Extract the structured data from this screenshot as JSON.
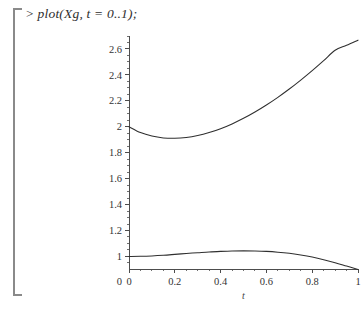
{
  "worksheet": {
    "prompt": ">",
    "command": "plot(Xg, t = 0..1);"
  },
  "chart_data": {
    "type": "line",
    "title": "",
    "xlabel": "t",
    "ylabel": "",
    "xlim": [
      0,
      1
    ],
    "ylim": [
      0.88,
      2.7
    ],
    "grid": false,
    "legend": "none",
    "x_ticks": [
      "0",
      "0.2",
      "0.4",
      "0.6",
      "0.8",
      "1"
    ],
    "x_tick_values": [
      0,
      0.2,
      0.4,
      0.6,
      0.8,
      1
    ],
    "x_minor_step": 0.05,
    "y_ticks": [
      "1",
      "1.2",
      "1.4",
      "1.6",
      "1.8",
      "2",
      "2.2",
      "2.4",
      "2.6"
    ],
    "y_tick_values": [
      1,
      1.2,
      1.4,
      1.6,
      1.8,
      2,
      2.2,
      2.4,
      2.6
    ],
    "y_minor_step": 0.05,
    "y_origin_label": "0",
    "axis_baseline": 0.9,
    "series": [
      {
        "name": "upper-curve",
        "x": [
          0,
          0.05,
          0.1,
          0.15,
          0.2,
          0.25,
          0.3,
          0.35,
          0.4,
          0.45,
          0.5,
          0.55,
          0.6,
          0.65,
          0.7,
          0.75,
          0.8,
          0.85,
          0.9,
          0.95,
          1
        ],
        "values": [
          2.0,
          1.955,
          1.928,
          1.914,
          1.911,
          1.917,
          1.932,
          1.955,
          1.985,
          2.022,
          2.065,
          2.114,
          2.168,
          2.227,
          2.291,
          2.36,
          2.433,
          2.51,
          2.59,
          2.628,
          2.668
        ]
      },
      {
        "name": "lower-curve",
        "x": [
          0,
          0.05,
          0.1,
          0.15,
          0.2,
          0.25,
          0.3,
          0.35,
          0.4,
          0.45,
          0.5,
          0.55,
          0.6,
          0.65,
          0.7,
          0.75,
          0.8,
          0.85,
          0.9,
          0.95,
          1
        ],
        "values": [
          1.0,
          1.001,
          1.004,
          1.009,
          1.016,
          1.023,
          1.029,
          1.035,
          1.039,
          1.042,
          1.043,
          1.042,
          1.039,
          1.033,
          1.024,
          1.011,
          0.995,
          0.975,
          0.952,
          0.926,
          0.9
        ]
      }
    ]
  }
}
